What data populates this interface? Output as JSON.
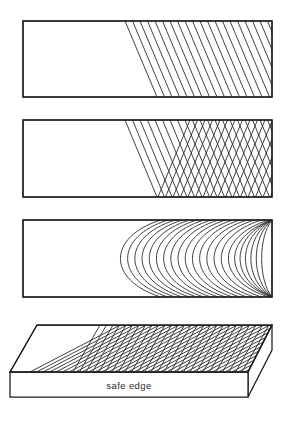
{
  "figure": {
    "background_color": "#ffffff",
    "line_color": "#1a1a1a",
    "hatch_color": "#2b2b2b",
    "width": 284,
    "height": 425
  },
  "labels": {
    "safe_edge": "safe edge"
  },
  "panels": [
    {
      "id": "panel-1",
      "name": "single-direction-hatch-panel",
      "kind": "rectangle",
      "x": 23,
      "y": 21,
      "width": 249,
      "height": 76,
      "hatch": [
        {
          "direction": "upper-left-to-lower-right",
          "angle_deg": 68,
          "spacing": 7.5,
          "start_x_top": 125,
          "start_x_bottom": 157
        }
      ]
    },
    {
      "id": "panel-2",
      "name": "cross-hatch-panel",
      "kind": "rectangle",
      "x": 23,
      "y": 120,
      "width": 249,
      "height": 77,
      "hatch": [
        {
          "direction": "upper-left-to-lower-right",
          "angle_deg": 68,
          "spacing": 7.5,
          "start_x_top": 125,
          "start_x_bottom": 157
        },
        {
          "direction": "lower-left-to-upper-right",
          "angle_deg": -68,
          "spacing": 7.5,
          "start_x_bottom": 158,
          "start_x_top": 190
        }
      ]
    },
    {
      "id": "panel-3",
      "name": "curved-arc-panel",
      "kind": "rectangle",
      "x": 23,
      "y": 220,
      "width": 249,
      "height": 77,
      "arcs": {
        "count": 22,
        "first_apex_x": 113,
        "spacing": 7.2,
        "bulge": "left",
        "anchored": "top-and-bottom-edges"
      }
    },
    {
      "id": "panel-4",
      "name": "three-dimensional-block",
      "kind": "isometric-block",
      "top_face": {
        "points": "37,325 272,325 248,372 10,372"
      },
      "front_face": {
        "points": "10,372 248,372 248,397 10,397"
      },
      "right_face": {
        "points": "248,372 272,325 272,350 248,397"
      },
      "hatch": [
        {
          "direction": "upper-left-to-lower-right",
          "spacing": 6.5
        },
        {
          "direction": "lower-left-to-upper-right",
          "spacing": 6.5
        }
      ],
      "caption": {
        "text_key": "safe_edge",
        "x": 129,
        "y": 388
      }
    }
  ]
}
